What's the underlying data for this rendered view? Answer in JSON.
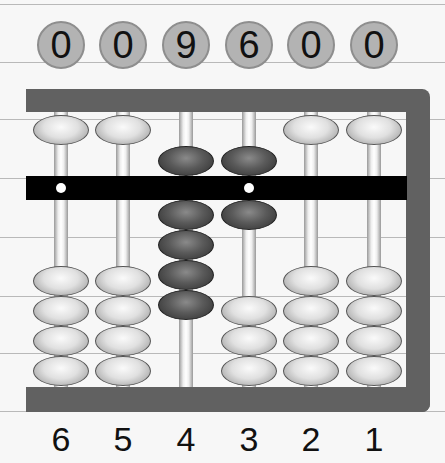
{
  "display": {
    "digits": [
      "0",
      "0",
      "9",
      "6",
      "0",
      "0"
    ],
    "value": "009600"
  },
  "abacus": {
    "type": "soroban",
    "columns": [
      {
        "label": "6",
        "digit": 0,
        "heaven_active": false,
        "earth_active": 0
      },
      {
        "label": "5",
        "digit": 0,
        "heaven_active": false,
        "earth_active": 0
      },
      {
        "label": "4",
        "digit": 9,
        "heaven_active": true,
        "earth_active": 4
      },
      {
        "label": "3",
        "digit": 6,
        "heaven_active": true,
        "earth_active": 1
      },
      {
        "label": "2",
        "digit": 0,
        "heaven_active": false,
        "earth_active": 0
      },
      {
        "label": "1",
        "digit": 0,
        "heaven_active": false,
        "earth_active": 0
      }
    ],
    "unit_dots_on_columns": [
      "6",
      "3"
    ],
    "colors": {
      "frame": "#616161",
      "beam": "#000000",
      "inactive_bead": "#e0e0e0",
      "active_bead": "#5a5a5a",
      "digit_circle": "#b3b3b3",
      "background": "#f7f7f7",
      "ruled_line": "#b9b9b9"
    }
  }
}
